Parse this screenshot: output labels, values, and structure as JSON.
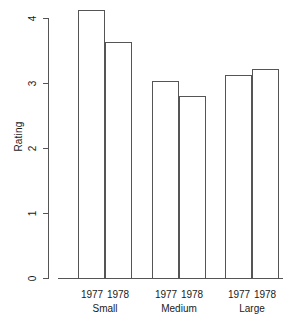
{
  "chart_data": {
    "type": "bar",
    "title": "",
    "subtitle": "",
    "xlabel": "",
    "ylabel": "Rating",
    "ylim": [
      0,
      4.3
    ],
    "yticks": [
      "0",
      "1",
      "2",
      "3",
      "4"
    ],
    "ytick_values": [
      0,
      1,
      2,
      3,
      4
    ],
    "grid": false,
    "legend": "none",
    "categories": [
      "Small",
      "Medium",
      "Large"
    ],
    "series": [
      {
        "name": "1977",
        "values": [
          4.12,
          3.03,
          3.13
        ]
      },
      {
        "name": "1978",
        "values": [
          3.63,
          2.8,
          3.22
        ]
      }
    ],
    "bars": [
      {
        "group": "Small",
        "year": "1977",
        "value": 4.12
      },
      {
        "group": "Small",
        "year": "1978",
        "value": 3.63
      },
      {
        "group": "Medium",
        "year": "1977",
        "value": 3.03
      },
      {
        "group": "Medium",
        "year": "1978",
        "value": 2.8
      },
      {
        "group": "Large",
        "year": "1977",
        "value": 3.13
      },
      {
        "group": "Large",
        "year": "1978",
        "value": 3.22
      }
    ],
    "colors": {
      "bar_fill": "#ffffff",
      "bar_stroke": "#555555",
      "axis": "#555555",
      "text": "#1a1a1a",
      "background": "#ffffff"
    }
  },
  "axis": {
    "y_title": "Rating",
    "ticks": [
      {
        "label": "4"
      },
      {
        "label": "3"
      },
      {
        "label": "2"
      },
      {
        "label": "1"
      },
      {
        "label": "0"
      }
    ]
  },
  "groups": [
    {
      "name": "Small",
      "years": [
        "1977",
        "1978"
      ]
    },
    {
      "name": "Medium",
      "years": [
        "1977",
        "1978"
      ]
    },
    {
      "name": "Large",
      "years": [
        "1977",
        "1978"
      ]
    }
  ]
}
